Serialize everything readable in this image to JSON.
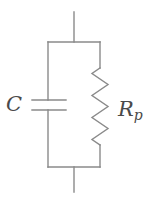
{
  "figure": {
    "kind": "circuit-diagram",
    "background_color": "#ffffff",
    "line_color": "#8a8a8a",
    "label_color": "#4a4a4a",
    "stroke_width": 1.4,
    "width": 149,
    "height": 199
  },
  "labels": {
    "capacitor": "C",
    "resistor_base": "R",
    "resistor_subscript": "p"
  },
  "components": {
    "capacitor": {
      "name": "capacitor",
      "symbol": "parallel-plates",
      "plate_top_y": 100,
      "plate_bottom_y": 110,
      "plate_x_start": 32,
      "plate_x_end": 66,
      "rail_x": 48
    },
    "resistor": {
      "name": "resistor",
      "symbol": "zigzag",
      "rail_x": 100,
      "zigzag_top_y": 68,
      "zigzag_bottom_y": 145,
      "zigzag_amplitude": 8,
      "zigzag_segments": 7
    }
  },
  "wiring": {
    "left_rail_x": 48,
    "right_rail_x": 100,
    "top_bar_y": 42,
    "bottom_bar_y": 167,
    "lead_x": 74,
    "top_lead_y": 12,
    "bottom_lead_y": 192
  }
}
